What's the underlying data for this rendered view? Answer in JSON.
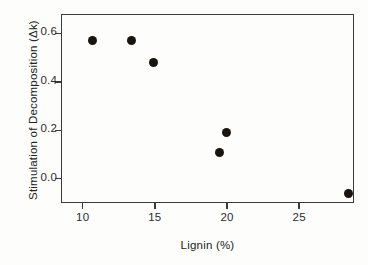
{
  "chart_data": {
    "type": "scatter",
    "title": "",
    "xlabel": "Lignin (%)",
    "ylabel": "Stimulation of Decomposition (Δk)",
    "xlim": [
      8.5,
      28.8
    ],
    "ylim": [
      -0.1,
      0.68
    ],
    "xticks": [
      10,
      15,
      20,
      25
    ],
    "xtick_labels": [
      "10",
      "15",
      "20",
      "25"
    ],
    "yticks": [
      0.0,
      0.2,
      0.4,
      0.6
    ],
    "ytick_labels": [
      "0.0",
      "0.2",
      "0.4",
      "0.6"
    ],
    "grid": false,
    "legend": false,
    "marker": "filled-circle",
    "marker_color": "#1a1411",
    "points": [
      {
        "x": 10.7,
        "y": 0.57
      },
      {
        "x": 13.4,
        "y": 0.57
      },
      {
        "x": 14.9,
        "y": 0.48
      },
      {
        "x": 19.5,
        "y": 0.11
      },
      {
        "x": 20.0,
        "y": 0.19
      },
      {
        "x": 28.4,
        "y": -0.06
      }
    ]
  },
  "colors": {
    "axis": "#3a3a3a",
    "text": "#222222",
    "marker": "#1a1411",
    "background": "#fdfdfc"
  }
}
